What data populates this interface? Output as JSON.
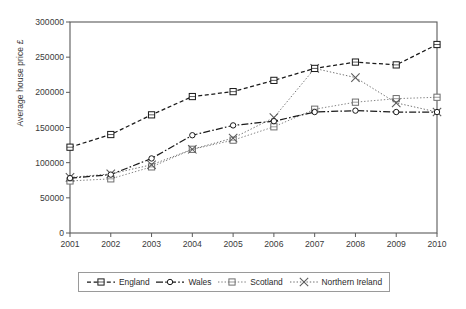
{
  "chart_data": {
    "type": "line",
    "title": "",
    "xlabel": "",
    "ylabel": "Average house price £",
    "categories": [
      "2001",
      "2002",
      "2003",
      "2004",
      "2005",
      "2006",
      "2007",
      "2008",
      "2009",
      "2010"
    ],
    "x": [
      2001,
      2002,
      2003,
      2004,
      2005,
      2006,
      2007,
      2008,
      2009,
      2010
    ],
    "xlim": [
      2001,
      2010
    ],
    "ylim": [
      0,
      300000
    ],
    "yticks": [
      0,
      50000,
      100000,
      150000,
      200000,
      250000,
      300000
    ],
    "ytick_labels": [
      "0",
      "50000",
      "100000",
      "150000",
      "200000",
      "250000",
      "300000"
    ],
    "grid": false,
    "legend_position": "bottom",
    "series": [
      {
        "name": "England",
        "marker": "square",
        "linestyle": "dashed",
        "color": "#1a1a1a",
        "values": [
          122000,
          140000,
          168000,
          194000,
          201000,
          217000,
          234000,
          243000,
          239000,
          268000
        ]
      },
      {
        "name": "Wales",
        "marker": "circle",
        "linestyle": "dash-dot",
        "color": "#1a1a1a",
        "values": [
          78000,
          83000,
          106000,
          139000,
          153000,
          159000,
          172000,
          174000,
          172000,
          172000
        ]
      },
      {
        "name": "Scotland",
        "marker": "square",
        "linestyle": "dotted",
        "color": "#6e6e6e",
        "values": [
          74000,
          77000,
          94000,
          119000,
          132000,
          151000,
          176000,
          186000,
          191000,
          193000
        ]
      },
      {
        "name": "Northern Ireland",
        "marker": "cross",
        "linestyle": "dotted",
        "color": "#5a5a5a",
        "values": [
          79000,
          84000,
          97000,
          119000,
          135000,
          164000,
          234000,
          221000,
          185000,
          172000
        ]
      }
    ]
  },
  "legend": {
    "items": [
      {
        "label": "England"
      },
      {
        "label": "Wales"
      },
      {
        "label": "Scotland"
      },
      {
        "label": "Northern Ireland"
      }
    ]
  }
}
